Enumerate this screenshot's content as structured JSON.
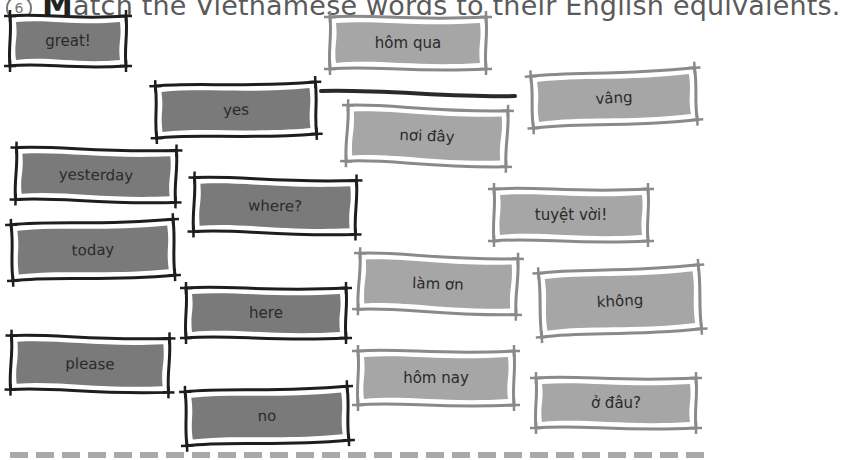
{
  "exercise": {
    "number": "6",
    "title_first_letter": "M",
    "title_rest": "atch the Vietnamese words to their English equivalents."
  },
  "colors": {
    "english_card_fill": "#7a7a7a",
    "english_card_border": "#1e1e1e",
    "vietnamese_card_fill": "#a6a6a6",
    "vietnamese_card_border": "#8a8a8a",
    "connector_line": "#2a2a2a",
    "dashed_rule": "#a9a9a9"
  },
  "english_words": [
    {
      "label": "great!",
      "x": 6,
      "y": 12,
      "w": 124,
      "h": 58,
      "tilt": 0
    },
    {
      "label": "yes",
      "x": 152,
      "y": 80,
      "w": 168,
      "h": 60,
      "tilt": -1.5
    },
    {
      "label": "yesterday",
      "x": 12,
      "y": 145,
      "w": 168,
      "h": 60,
      "tilt": 1
    },
    {
      "label": "where?",
      "x": 190,
      "y": 175,
      "w": 170,
      "h": 62,
      "tilt": 1
    },
    {
      "label": "today",
      "x": 8,
      "y": 218,
      "w": 170,
      "h": 64,
      "tilt": -2
    },
    {
      "label": "here",
      "x": 182,
      "y": 284,
      "w": 168,
      "h": 58,
      "tilt": 0
    },
    {
      "label": "please",
      "x": 7,
      "y": 333,
      "w": 166,
      "h": 62,
      "tilt": 1
    },
    {
      "label": "no",
      "x": 182,
      "y": 385,
      "w": 170,
      "h": 62,
      "tilt": -2
    }
  ],
  "vietnamese_words": [
    {
      "label": "hôm qua",
      "x": 326,
      "y": 13,
      "w": 164,
      "h": 60,
      "tilt": 0
    },
    {
      "label": "vâng",
      "x": 528,
      "y": 68,
      "w": 172,
      "h": 60,
      "tilt": -3
    },
    {
      "label": "nơi đây",
      "x": 343,
      "y": 104,
      "w": 168,
      "h": 64,
      "tilt": 2
    },
    {
      "label": "tuyệt vời!",
      "x": 490,
      "y": 185,
      "w": 162,
      "h": 60,
      "tilt": 0
    },
    {
      "label": "làm ơn",
      "x": 355,
      "y": 252,
      "w": 166,
      "h": 64,
      "tilt": 2
    },
    {
      "label": "không",
      "x": 536,
      "y": 265,
      "w": 168,
      "h": 72,
      "tilt": -3
    },
    {
      "label": "hôm nay",
      "x": 354,
      "y": 347,
      "w": 164,
      "h": 62,
      "tilt": 0
    },
    {
      "label": "ở đâu?",
      "x": 532,
      "y": 374,
      "w": 168,
      "h": 58,
      "tilt": 0
    }
  ],
  "answer_line": {
    "from": "yes",
    "to": "vâng",
    "x1": 321,
    "y1": 91,
    "x2": 515,
    "y2": 96
  }
}
